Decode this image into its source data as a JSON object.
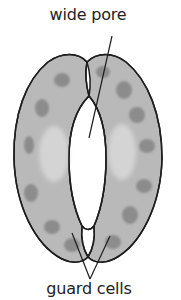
{
  "diagram": {
    "labels": {
      "top": "wide pore",
      "bottom": "guard cells"
    },
    "colors": {
      "background": "#ffffff",
      "cell_fill": "#b9b9b9",
      "cell_outline": "#1e1e1e",
      "pore_fill": "#ffffff",
      "chloroplast": "#8c8c8c",
      "vacuole_light": "#d4d4d4",
      "label_text": "#222222",
      "pointer_line": "#1e1e1e"
    }
  }
}
